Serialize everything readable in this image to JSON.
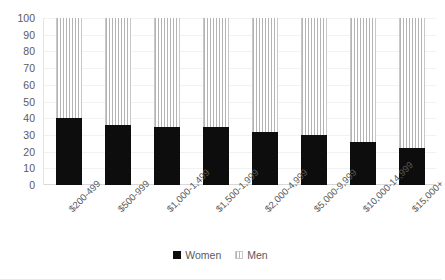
{
  "chart_data": {
    "type": "bar",
    "subtype": "stacked-percent",
    "title": "",
    "xlabel": "",
    "ylabel": "",
    "ylim": [
      0,
      100
    ],
    "ytick_step": 10,
    "yticks": [
      100,
      90,
      80,
      70,
      60,
      50,
      40,
      30,
      20,
      10,
      0
    ],
    "grid": true,
    "legend_position": "bottom",
    "categories": [
      "$200-499",
      "$500-999",
      "$1,000-1,499",
      "$1,500-1,999",
      "$2,000-4,999",
      "$5,000-9,999",
      "$10,000-14,999",
      "$15,000+"
    ],
    "series": [
      {
        "name": "Women",
        "color": "#0d0d0d",
        "values": [
          40,
          36,
          35,
          35,
          32,
          30,
          26,
          22
        ]
      },
      {
        "name": "Men",
        "color": "#b4b4b4",
        "values": [
          60,
          64,
          65,
          65,
          68,
          70,
          74,
          78
        ]
      }
    ]
  },
  "legend": {
    "items": [
      {
        "label": "Women",
        "swatch": "women-swatch"
      },
      {
        "label": "Men",
        "swatch": "men-swatch"
      }
    ]
  }
}
